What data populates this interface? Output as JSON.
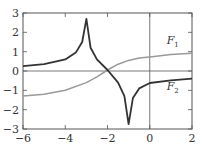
{
  "chart_data": {
    "type": "line",
    "title": "",
    "xlabel": "",
    "ylabel": "",
    "xlim": [
      -6,
      2
    ],
    "ylim": [
      -3,
      3
    ],
    "x_ticks": [
      "-6",
      "-4",
      "-2",
      "0",
      "2"
    ],
    "y_ticks": [
      "3",
      "2",
      "1",
      "0",
      "-1",
      "-2",
      "-3"
    ],
    "grid": false,
    "reference_lines": {
      "y": 0,
      "x": 0
    },
    "series": [
      {
        "name": "F1",
        "color": "#999999",
        "x": [
          -6,
          -5,
          -4,
          -3,
          -2.5,
          -2,
          -1.5,
          -1,
          -0.5,
          0,
          1,
          2
        ],
        "values": [
          -1.3,
          -1.2,
          -1.0,
          -0.6,
          -0.3,
          0.05,
          0.35,
          0.55,
          0.67,
          0.73,
          0.85,
          0.92
        ]
      },
      {
        "name": "F2",
        "color": "#333333",
        "x": [
          -6,
          -5,
          -4,
          -3.5,
          -3.2,
          -3.0,
          -2.8,
          -2.5,
          -2,
          -1.5,
          -1.2,
          -1.0,
          -0.8,
          -0.5,
          0,
          1,
          2
        ],
        "values": [
          0.25,
          0.35,
          0.6,
          0.95,
          1.5,
          2.7,
          1.2,
          0.6,
          0.05,
          -0.6,
          -1.3,
          -2.75,
          -1.4,
          -0.9,
          -0.62,
          -0.48,
          -0.4
        ]
      }
    ],
    "annotations": [
      {
        "text": "F",
        "subscript": "1",
        "x": 0.8,
        "y": 1.4
      },
      {
        "text": "F",
        "subscript": "2",
        "x": 0.8,
        "y": -1.0
      }
    ]
  }
}
